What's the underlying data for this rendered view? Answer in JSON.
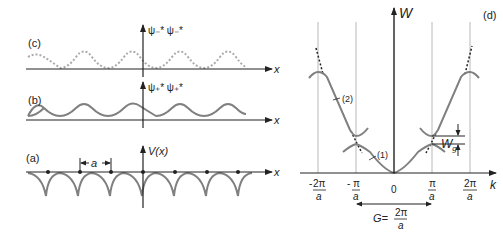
{
  "colors": {
    "curve": "#808080",
    "axis": "#222222",
    "gridline": "#b8b8b8",
    "dotted": "#aaaaaa"
  },
  "left": {
    "panel_c": {
      "label": "(c)",
      "ylabel": "ψ₋* ψ₋*",
      "xlabel": "x"
    },
    "panel_b": {
      "label": "(b)",
      "ylabel": "ψ₊* ψ₊*",
      "xlabel": "x"
    },
    "panel_a": {
      "label": "(a)",
      "ylabel": "V(x)",
      "xlabel": "x",
      "spacing_label": "a"
    }
  },
  "right": {
    "panel_label": "(d)",
    "ylabel": "W",
    "xlabel": "k",
    "band1_label": "(1)",
    "band2_label": "(2)",
    "gap_label": "W",
    "gap_sub": "g",
    "ticks": [
      {
        "sign": "-",
        "num": "2π",
        "den": "a"
      },
      {
        "sign": "-",
        "num": "π",
        "den": "a"
      },
      {
        "sign": "",
        "num": "0",
        "den": ""
      },
      {
        "sign": "",
        "num": "π",
        "den": "a"
      },
      {
        "sign": "",
        "num": "2π",
        "den": "a"
      }
    ],
    "G_label": "G=",
    "G_num": "2π",
    "G_den": "a"
  }
}
